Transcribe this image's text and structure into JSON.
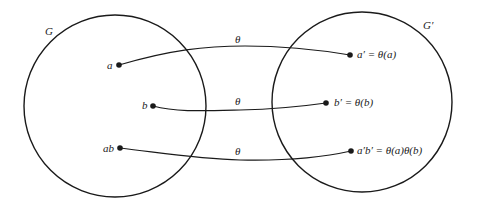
{
  "diagram": {
    "left_group": {
      "label": "G",
      "cx": 115,
      "cy": 106,
      "r": 91
    },
    "right_group": {
      "label": "G′",
      "cx": 362,
      "cy": 102,
      "r": 90
    },
    "mappings": [
      {
        "source_label": "a",
        "target_label": "a′ = θ(a)",
        "arrow_label": "θ"
      },
      {
        "source_label": "b",
        "target_label": "b′ = θ(b)",
        "arrow_label": "θ"
      },
      {
        "source_label": "ab",
        "target_label": "a′b′ = θ(a)θ(b)",
        "arrow_label": "θ"
      }
    ],
    "stroke_color": "#1a1a1a"
  }
}
